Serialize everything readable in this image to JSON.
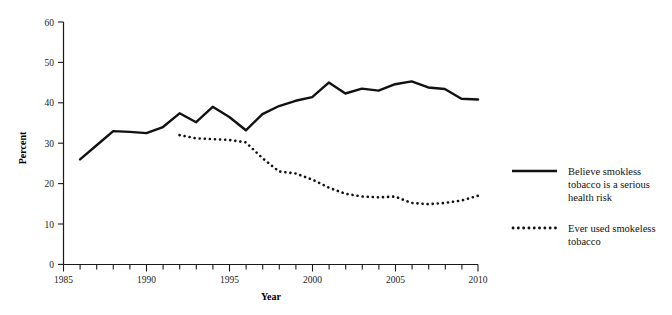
{
  "chart_data": {
    "type": "line",
    "title": "",
    "subtitle": "",
    "xlabel": "Year",
    "ylabel": "Percent",
    "xlim": [
      1985,
      2010
    ],
    "ylim": [
      0,
      60
    ],
    "grid": false,
    "legend_position": "right",
    "x_ticks_major": [
      1985,
      1990,
      1995,
      2000,
      2005,
      2010
    ],
    "x_tick_labels": [
      "1985",
      "1990",
      "1995",
      "2000",
      "2005",
      "2010"
    ],
    "x_ticks_minor_step": 1,
    "y_ticks": [
      0,
      10,
      20,
      30,
      40,
      50,
      60
    ],
    "y_tick_labels": [
      "0",
      "10",
      "20",
      "30",
      "40",
      "50",
      "60"
    ],
    "series": [
      {
        "name": "Believe smokless tobacco is a serious health risk",
        "style": "solid",
        "color": "#111111",
        "x": [
          1986,
          1987,
          1988,
          1989,
          1990,
          1991,
          1992,
          1993,
          1994,
          1995,
          1996,
          1997,
          1998,
          1999,
          2000,
          2001,
          2002,
          2003,
          2004,
          2005,
          2006,
          2007,
          2008,
          2009,
          2010
        ],
        "values": [
          26.0,
          29.5,
          33.0,
          32.8,
          32.5,
          34.0,
          37.4,
          35.2,
          39.0,
          36.5,
          33.2,
          37.2,
          39.2,
          40.5,
          41.4,
          45.0,
          42.3,
          43.5,
          43.0,
          44.6,
          45.3,
          43.8,
          43.4,
          41.0,
          40.8
        ]
      },
      {
        "name": "Ever used smokeless tobacco",
        "style": "dotted",
        "color": "#111111",
        "x": [
          1992,
          1993,
          1994,
          1995,
          1996,
          1997,
          1998,
          1999,
          2000,
          2001,
          2002,
          2003,
          2004,
          2005,
          2006,
          2007,
          2008,
          2009,
          2010
        ],
        "values": [
          32.0,
          31.2,
          31.0,
          30.8,
          30.2,
          26.3,
          23.0,
          22.5,
          21.0,
          19.0,
          17.5,
          16.8,
          16.6,
          16.8,
          15.2,
          14.9,
          15.2,
          15.8,
          17.0
        ]
      }
    ],
    "legend_entries": [
      {
        "style": "solid",
        "lines": [
          "Believe smokless",
          "tobacco is a serious",
          "health risk"
        ]
      },
      {
        "style": "dotted",
        "lines": [
          "Ever used smokeless",
          "tobacco"
        ]
      }
    ],
    "colors": {
      "line": "#111111",
      "axis": "#1a1a1a",
      "background": "#ffffff"
    }
  }
}
